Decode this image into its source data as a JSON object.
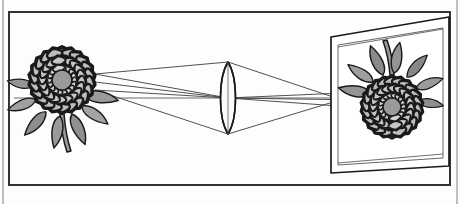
{
  "figure": {
    "type": "ray-diagram",
    "domain": "optics",
    "canvas": {
      "width": 461,
      "height": 204,
      "background": "#fdfdfd"
    }
  },
  "colors": {
    "outline": "#1a1a1a",
    "ray_line": "#3c3c3c",
    "optical_axis": "#555555",
    "frame_border": "#2b2b2b",
    "frame_thin": "#8a8a8a",
    "petal_light": "#cfcfcf",
    "petal_mid": "#b8b8b8",
    "petal_dark": "#a6a6a6",
    "flower_center": "#9a9a9a",
    "leaf_light": "#b0b0b0",
    "leaf_mid": "#9a9a9a",
    "leaf_dark": "#878787",
    "stem": "#9a9a9a",
    "screen_face": "#ffffff",
    "lens_fill": "#fbfbfb",
    "paper": "#fdfdfd"
  },
  "frame": {
    "outer": {
      "x": 8,
      "y": 11,
      "width": 442,
      "height": 174
    },
    "thin_left_line_x": 3,
    "thin_right_line_x": 457,
    "border_width": 2
  },
  "object_flower": {
    "label": "object-flower",
    "center": {
      "x": 62,
      "y": 80
    },
    "bloom_radius": 33,
    "center_disc_radius": 10,
    "orientation": "upright",
    "petal_rings": [
      {
        "count": 18,
        "inner": 10,
        "outer": 19,
        "fill": "#cfcfcf"
      },
      {
        "count": 20,
        "inner": 17,
        "outer": 27,
        "fill": "#c4c4c4"
      },
      {
        "count": 22,
        "inner": 25,
        "outer": 34,
        "fill": "#bdbdbd"
      }
    ],
    "leaves": 7,
    "stem": {
      "from": {
        "x": 62,
        "y": 122
      },
      "to": {
        "x": 66,
        "y": 152
      }
    }
  },
  "lens": {
    "label": "converging-biconvex-lens",
    "center": {
      "x": 228,
      "y": 98
    },
    "top": {
      "x": 228,
      "y": 62
    },
    "bottom": {
      "x": 228,
      "y": 134
    },
    "half_width": 10,
    "type": "biconvex",
    "fill": "#fbfbfb"
  },
  "optical_axis": {
    "label": "optical-axis",
    "y": 98,
    "x_start": 12,
    "x_end": 448
  },
  "screen": {
    "label": "projection-screen",
    "corners": {
      "top_left": {
        "x": 331,
        "y": 37
      },
      "top_right": {
        "x": 449,
        "y": 17
      },
      "bottom_right": {
        "x": 449,
        "y": 166
      },
      "bottom_left": {
        "x": 331,
        "y": 173
      }
    },
    "inner_corners": {
      "top_left": {
        "x": 338,
        "y": 45
      },
      "top_right": {
        "x": 443,
        "y": 27
      },
      "bottom_right": {
        "x": 443,
        "y": 158
      },
      "bottom_left": {
        "x": 338,
        "y": 165
      }
    }
  },
  "image_flower": {
    "label": "image-flower-inverted",
    "center": {
      "x": 392,
      "y": 107
    },
    "bloom_radius": 31,
    "center_disc_radius": 9,
    "orientation": "inverted",
    "rotation_degrees": 180,
    "petal_rings": [
      {
        "count": 18,
        "inner": 9,
        "outer": 18,
        "fill": "#cfcfcf"
      },
      {
        "count": 20,
        "inner": 16,
        "outer": 25,
        "fill": "#c4c4c4"
      },
      {
        "count": 22,
        "inner": 23,
        "outer": 32,
        "fill": "#bdbdbd"
      }
    ],
    "leaves": 7,
    "stem": {
      "from": {
        "x": 392,
        "y": 68
      },
      "to": {
        "x": 388,
        "y": 38
      }
    }
  },
  "rays": [
    {
      "name": "ray-from-top",
      "object_point": {
        "x": 95,
        "y": 74
      },
      "lens_point": {
        "x": 228,
        "y": 62
      },
      "image_point": {
        "x": 366,
        "y": 92
      }
    },
    {
      "name": "ray-through-center",
      "object_point": {
        "x": 95,
        "y": 82
      },
      "lens_point": {
        "x": 228,
        "y": 98
      },
      "image_point": {
        "x": 366,
        "y": 100
      }
    },
    {
      "name": "ray-from-bottom",
      "object_point": {
        "x": 95,
        "y": 90
      },
      "lens_point": {
        "x": 228,
        "y": 134
      },
      "image_point": {
        "x": 366,
        "y": 108
      }
    }
  ],
  "screen_guide_lines": [
    {
      "name": "screen-guide-upper",
      "from": {
        "x": 336,
        "y": 48
      },
      "to": {
        "x": 443,
        "y": 30
      }
    },
    {
      "name": "screen-guide-lower",
      "from": {
        "x": 336,
        "y": 160
      },
      "to": {
        "x": 443,
        "y": 150
      }
    }
  ]
}
